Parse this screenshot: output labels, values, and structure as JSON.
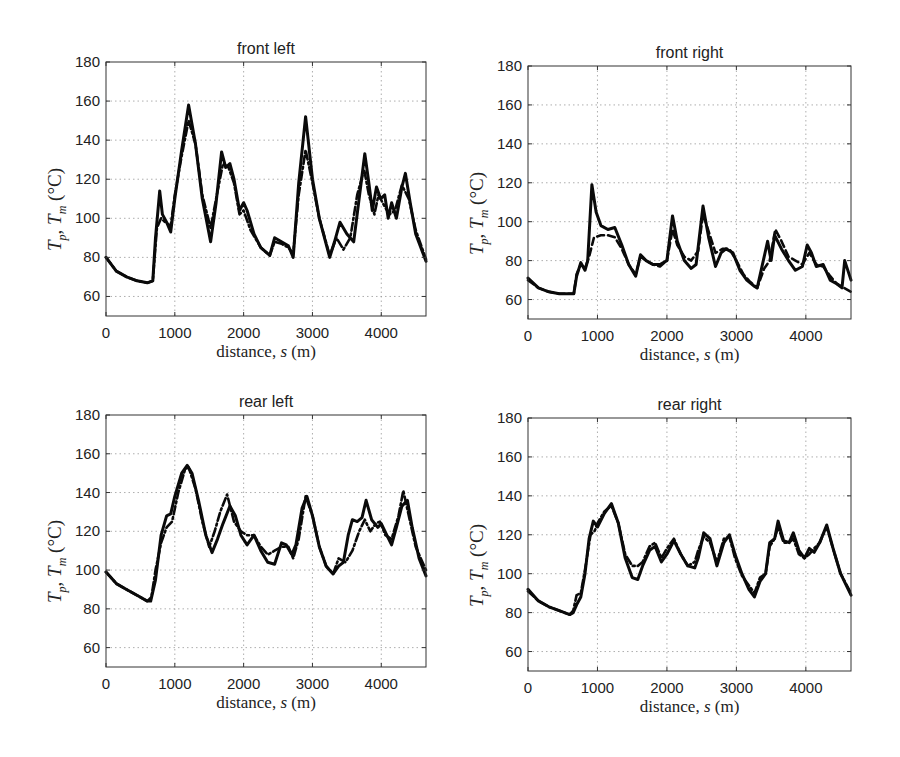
{
  "figure": {
    "ylabel_main": "T",
    "ylabel_sub1": "p",
    "ylabel_sep": ", ",
    "ylabel_sub2": "m",
    "ylabel_unit": " (°C)",
    "xlabel_text": "distance, ",
    "xlabel_var": "s",
    "xlabel_unit": " (m)"
  },
  "chart_data": [
    {
      "type": "line",
      "title": "front left",
      "xlabel": "distance, s (m)",
      "ylabel": "T_p, T_m (°C)",
      "xlim": [
        0,
        4650
      ],
      "ylim": [
        50,
        180
      ],
      "xticks": [
        0,
        1000,
        2000,
        3000,
        4000
      ],
      "yticks": [
        60,
        80,
        100,
        120,
        140,
        160,
        180
      ],
      "grid": true,
      "legend": null,
      "series": [
        {
          "name": "T_p (solid)",
          "style": "solid",
          "x": [
            0,
            150,
            300,
            450,
            600,
            680,
            720,
            780,
            820,
            880,
            940,
            1000,
            1100,
            1200,
            1300,
            1400,
            1520,
            1600,
            1680,
            1740,
            1800,
            1860,
            1940,
            2000,
            2050,
            2150,
            2250,
            2380,
            2450,
            2550,
            2650,
            2720,
            2800,
            2900,
            3000,
            3100,
            3250,
            3320,
            3400,
            3500,
            3600,
            3700,
            3760,
            3820,
            3870,
            3930,
            3990,
            4050,
            4100,
            4150,
            4220,
            4300,
            4350,
            4420,
            4500,
            4650
          ],
          "y": [
            80,
            73,
            70,
            68,
            67,
            68,
            90,
            114,
            102,
            98,
            93,
            110,
            135,
            158,
            138,
            110,
            88,
            108,
            134,
            126,
            128,
            120,
            104,
            108,
            104,
            92,
            85,
            81,
            90,
            88,
            86,
            80,
            118,
            152,
            120,
            100,
            80,
            88,
            98,
            92,
            88,
            116,
            133,
            118,
            104,
            116,
            110,
            112,
            100,
            108,
            100,
            116,
            123,
            108,
            92,
            78
          ]
        },
        {
          "name": "T_m (dash-dot)",
          "style": "dashdot",
          "x": [
            0,
            150,
            300,
            450,
            600,
            680,
            740,
            800,
            860,
            940,
            1000,
            1100,
            1200,
            1300,
            1400,
            1520,
            1600,
            1700,
            1780,
            1860,
            1940,
            2000,
            2100,
            2250,
            2380,
            2450,
            2550,
            2650,
            2720,
            2800,
            2900,
            3000,
            3100,
            3250,
            3350,
            3450,
            3550,
            3650,
            3750,
            3820,
            3900,
            3960,
            4050,
            4120,
            4200,
            4300,
            4400,
            4500,
            4650
          ],
          "y": [
            80,
            73,
            70,
            68,
            67,
            68,
            95,
            100,
            98,
            96,
            112,
            132,
            150,
            138,
            112,
            95,
            110,
            128,
            126,
            118,
            102,
            104,
            94,
            85,
            81,
            88,
            87,
            85,
            82,
            112,
            135,
            118,
            100,
            81,
            90,
            84,
            90,
            112,
            125,
            112,
            102,
            112,
            106,
            102,
            104,
            117,
            110,
            94,
            79
          ]
        }
      ]
    },
    {
      "type": "line",
      "title": "front right",
      "xlabel": "distance, s (m)",
      "ylabel": "T_p, T_m (°C)",
      "xlim": [
        0,
        4650
      ],
      "ylim": [
        50,
        180
      ],
      "xticks": [
        0,
        1000,
        2000,
        3000,
        4000
      ],
      "yticks": [
        60,
        80,
        100,
        120,
        140,
        160,
        180
      ],
      "grid": true,
      "legend": null,
      "series": [
        {
          "name": "T_p (solid)",
          "style": "solid",
          "x": [
            0,
            150,
            300,
            450,
            600,
            660,
            700,
            760,
            820,
            860,
            920,
            980,
            1050,
            1150,
            1250,
            1350,
            1450,
            1550,
            1620,
            1700,
            1800,
            1900,
            2000,
            2080,
            2150,
            2250,
            2350,
            2420,
            2520,
            2600,
            2700,
            2780,
            2850,
            2950,
            3050,
            3150,
            3250,
            3300,
            3400,
            3450,
            3500,
            3550,
            3650,
            3750,
            3850,
            3950,
            4020,
            4080,
            4150,
            4250,
            4350,
            4450,
            4520,
            4560,
            4650
          ],
          "y": [
            71,
            66,
            64,
            63,
            63,
            63,
            72,
            79,
            75,
            80,
            119,
            105,
            98,
            96,
            97,
            88,
            78,
            72,
            83,
            80,
            78,
            78,
            80,
            103,
            90,
            80,
            76,
            78,
            108,
            92,
            77,
            84,
            86,
            84,
            75,
            70,
            67,
            66,
            82,
            90,
            80,
            93,
            86,
            80,
            75,
            77,
            88,
            84,
            77,
            78,
            70,
            68,
            66,
            80,
            70
          ]
        },
        {
          "name": "T_m (dashed)",
          "style": "dashed",
          "x": [
            0,
            150,
            300,
            450,
            600,
            660,
            700,
            760,
            820,
            880,
            950,
            1050,
            1150,
            1250,
            1350,
            1450,
            1550,
            1620,
            1700,
            1800,
            1900,
            2000,
            2080,
            2150,
            2250,
            2350,
            2450,
            2520,
            2600,
            2700,
            2800,
            2900,
            3000,
            3100,
            3200,
            3300,
            3400,
            3480,
            3560,
            3650,
            3750,
            3850,
            3950,
            4050,
            4150,
            4250,
            4350,
            4450,
            4550,
            4650
          ],
          "y": [
            70,
            66,
            64,
            63,
            63,
            63,
            73,
            78,
            76,
            82,
            92,
            93,
            93,
            92,
            86,
            78,
            73,
            82,
            80,
            78,
            77,
            80,
            96,
            88,
            82,
            80,
            85,
            104,
            95,
            84,
            86,
            86,
            80,
            73,
            69,
            66,
            76,
            80,
            96,
            90,
            82,
            80,
            78,
            84,
            78,
            77,
            72,
            68,
            66,
            64
          ]
        }
      ]
    },
    {
      "type": "line",
      "title": "rear left",
      "xlabel": "distance, s (m)",
      "ylabel": "T_p, T_m (°C)",
      "xlim": [
        0,
        4650
      ],
      "ylim": [
        50,
        180
      ],
      "xticks": [
        0,
        1000,
        2000,
        3000,
        4000
      ],
      "yticks": [
        60,
        80,
        100,
        120,
        140,
        160,
        180
      ],
      "grid": true,
      "legend": null,
      "series": [
        {
          "name": "T_p (solid)",
          "style": "solid",
          "x": [
            0,
            150,
            300,
            450,
            600,
            650,
            720,
            800,
            880,
            940,
            1000,
            1100,
            1180,
            1250,
            1350,
            1450,
            1540,
            1620,
            1700,
            1800,
            1880,
            1960,
            2050,
            2150,
            2250,
            2350,
            2450,
            2550,
            2620,
            2700,
            2760,
            2850,
            2920,
            3000,
            3100,
            3200,
            3300,
            3380,
            3450,
            3520,
            3580,
            3650,
            3720,
            3780,
            3860,
            3950,
            4000,
            4080,
            4150,
            4220,
            4300,
            4380,
            4450,
            4550,
            4650
          ],
          "y": [
            99,
            93,
            90,
            87,
            84,
            84,
            95,
            118,
            128,
            129,
            138,
            150,
            154,
            150,
            135,
            118,
            109,
            116,
            124,
            133,
            128,
            118,
            113,
            118,
            110,
            104,
            103,
            114,
            113,
            108,
            113,
            132,
            138,
            128,
            112,
            102,
            98,
            102,
            104,
            118,
            126,
            125,
            127,
            136,
            126,
            122,
            124,
            118,
            113,
            122,
            133,
            136,
            122,
            106,
            97
          ]
        },
        {
          "name": "T_m (dash-dot)",
          "style": "dashdot",
          "x": [
            0,
            150,
            300,
            450,
            600,
            660,
            720,
            800,
            880,
            960,
            1050,
            1150,
            1200,
            1300,
            1400,
            1500,
            1580,
            1660,
            1760,
            1860,
            1960,
            2050,
            2150,
            2250,
            2350,
            2450,
            2550,
            2650,
            2720,
            2800,
            2900,
            3000,
            3100,
            3200,
            3300,
            3380,
            3480,
            3580,
            3680,
            3760,
            3840,
            3920,
            3980,
            4060,
            4150,
            4250,
            4320,
            4400,
            4500,
            4650
          ],
          "y": [
            99,
            93,
            90,
            87,
            84,
            86,
            100,
            114,
            122,
            125,
            140,
            152,
            153,
            142,
            125,
            112,
            120,
            130,
            139,
            125,
            120,
            118,
            118,
            112,
            108,
            110,
            112,
            112,
            106,
            116,
            138,
            128,
            112,
            102,
            98,
            106,
            104,
            110,
            120,
            126,
            120,
            124,
            125,
            118,
            116,
            128,
            141,
            128,
            112,
            100
          ]
        }
      ]
    },
    {
      "type": "line",
      "title": "rear right",
      "xlabel": "distance, s (m)",
      "ylabel": "T_p, T_m (°C)",
      "xlim": [
        0,
        4650
      ],
      "ylim": [
        50,
        180
      ],
      "xticks": [
        0,
        1000,
        2000,
        3000,
        4000
      ],
      "yticks": [
        60,
        80,
        100,
        120,
        140,
        160,
        180
      ],
      "grid": true,
      "legend": null,
      "series": [
        {
          "name": "T_p (solid)",
          "style": "solid",
          "x": [
            0,
            150,
            300,
            450,
            600,
            650,
            700,
            760,
            820,
            880,
            940,
            1000,
            1100,
            1200,
            1300,
            1400,
            1500,
            1580,
            1650,
            1750,
            1830,
            1920,
            2000,
            2100,
            2200,
            2300,
            2400,
            2450,
            2530,
            2620,
            2720,
            2820,
            2900,
            2980,
            3080,
            3180,
            3260,
            3340,
            3420,
            3480,
            3550,
            3600,
            3680,
            3760,
            3820,
            3900,
            3980,
            4050,
            4120,
            4200,
            4300,
            4400,
            4500,
            4650
          ],
          "y": [
            92,
            86,
            83,
            81,
            79,
            80,
            84,
            88,
            100,
            118,
            127,
            124,
            131,
            136,
            126,
            108,
            98,
            97,
            104,
            112,
            114,
            106,
            110,
            117,
            110,
            104,
            103,
            108,
            121,
            118,
            104,
            116,
            120,
            110,
            100,
            92,
            88,
            96,
            100,
            116,
            118,
            127,
            117,
            116,
            121,
            112,
            108,
            113,
            111,
            116,
            125,
            112,
            100,
            89
          ]
        },
        {
          "name": "T_m (dash-dot)",
          "style": "dashdot",
          "x": [
            0,
            150,
            300,
            450,
            600,
            650,
            700,
            760,
            820,
            900,
            960,
            1000,
            1100,
            1200,
            1300,
            1400,
            1500,
            1580,
            1650,
            1750,
            1830,
            1920,
            2000,
            2100,
            2200,
            2300,
            2400,
            2450,
            2530,
            2620,
            2720,
            2820,
            2900,
            2980,
            3080,
            3180,
            3260,
            3340,
            3420,
            3480,
            3550,
            3600,
            3680,
            3760,
            3820,
            3900,
            3980,
            4050,
            4120,
            4200,
            4300,
            4400,
            4500,
            4650
          ],
          "y": [
            91,
            86,
            83,
            81,
            79,
            81,
            89,
            90,
            102,
            120,
            122,
            126,
            132,
            135,
            126,
            110,
            104,
            104,
            106,
            114,
            116,
            108,
            113,
            118,
            110,
            104,
            106,
            112,
            119,
            116,
            106,
            118,
            119,
            108,
            99,
            94,
            90,
            98,
            100,
            114,
            118,
            124,
            116,
            116,
            118,
            110,
            108,
            110,
            113,
            116,
            124,
            112,
            100,
            90
          ]
        }
      ]
    }
  ]
}
